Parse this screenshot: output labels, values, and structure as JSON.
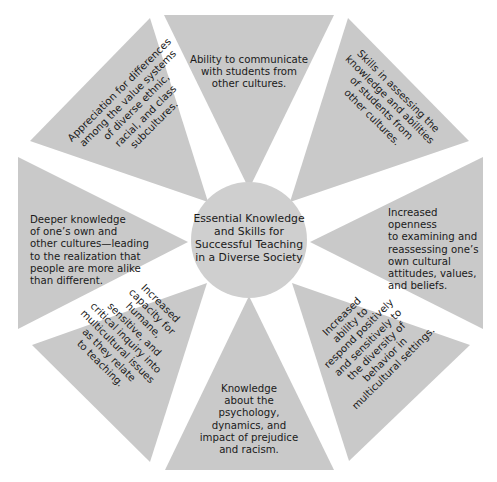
{
  "diagram": {
    "center": {
      "title": "Essential Knowledge\nand Skills for\nSuccessful Teaching\nin a Diverse Society"
    },
    "segments": [
      {
        "id": "top",
        "text": "Ability to communicate\nwith students from\nother cultures."
      },
      {
        "id": "top-right",
        "text": "Skills in assessing the\nknowledge and abilities\nof students from\nother cultures."
      },
      {
        "id": "right",
        "text": "Increased openness\nto examining and\nreassessing one’s\nown cultural\nattitudes, values,\nand beliefs."
      },
      {
        "id": "bottom-right",
        "text": "Increased\nability to\nrespond positively\nand sensitively to\nthe diversity of\nbehavior in\nmulticultural settings."
      },
      {
        "id": "bottom",
        "text": "Knowledge\nabout the\npsychology,\ndynamics, and\nimpact of prejudice\nand racism."
      },
      {
        "id": "bottom-left",
        "text": "Increased\ncapacity for\nhumane,\nsensitive, and\ncritical inquiry into\nmulticultural issues\nas they relate\nto teaching."
      },
      {
        "id": "left",
        "text": "Deeper knowledge\nof one’s own and\nother cultures—leading\nto the realization that\npeople are more alike\nthan different."
      },
      {
        "id": "top-left",
        "text": "Appreciation for differences\namong the value systems\nof diverse ethnic,\nracial, and class\nsubcultures."
      }
    ],
    "colors": {
      "segment_fill": "#c9c9c9",
      "hub_fill": "#cfcfcf",
      "text": "#1a1a1a",
      "background": "#ffffff"
    }
  }
}
